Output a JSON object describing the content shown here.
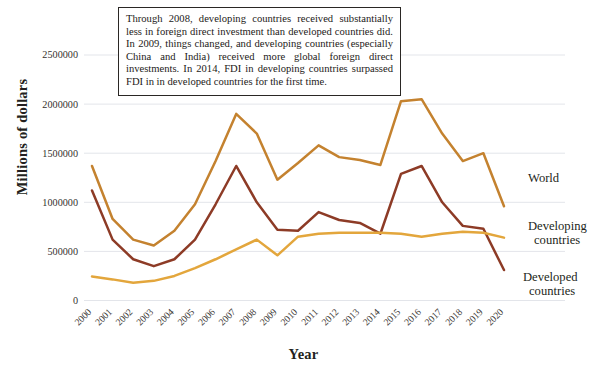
{
  "note": {
    "text": "Through 2008, developing countries received substantially less in foreign direct investment than developed countries did. In 2009, things changed, and developing countries (especially China and India) received more global foreign direct investments. In 2014, FDI in developing countries surpassed FDI in in developed countries for the first time."
  },
  "chart_data": {
    "type": "line",
    "title": "",
    "xlabel": "Year",
    "ylabel": "Millions of dollars",
    "grid": true,
    "legend_position": "right-inline",
    "ylim": [
      0,
      2750000
    ],
    "yticks": [
      0,
      500000,
      1000000,
      1500000,
      2000000,
      2500000
    ],
    "ytick_labels": [
      "0",
      "500000",
      "1000000",
      "1500000",
      "2000000",
      "2500000"
    ],
    "categories": [
      "2000",
      "2001",
      "2002",
      "2003",
      "2004",
      "2005",
      "2006",
      "2007",
      "2008",
      "2009",
      "2010",
      "2011",
      "2012",
      "2013",
      "2014",
      "2015",
      "2016",
      "2017",
      "2018",
      "2019",
      "2020"
    ],
    "series": [
      {
        "name": "World",
        "color": "#c4822f",
        "label_x": 531,
        "label_y": 184,
        "values": [
          1370000,
          830000,
          620000,
          560000,
          710000,
          980000,
          1420000,
          1900000,
          1700000,
          1230000,
          1400000,
          1580000,
          1460000,
          1430000,
          1380000,
          2030000,
          2050000,
          1700000,
          1420000,
          1500000,
          960000
        ]
      },
      {
        "name": "Developing countries",
        "color": "#8d3b26",
        "label_x": 528,
        "label_y": 288,
        "label_lines": [
          "Developed",
          "countries"
        ],
        "values": [
          1120000,
          620000,
          420000,
          350000,
          420000,
          620000,
          980000,
          1370000,
          1000000,
          720000,
          710000,
          900000,
          820000,
          790000,
          680000,
          1290000,
          1370000,
          1000000,
          760000,
          730000,
          310000
        ]
      },
      {
        "name": "Developing countries",
        "color": "#e3a63c",
        "label_x": 528,
        "label_y": 232,
        "label_lines": [
          "Developing",
          "countries"
        ],
        "values": [
          245000,
          215000,
          180000,
          200000,
          250000,
          330000,
          420000,
          520000,
          620000,
          460000,
          650000,
          680000,
          690000,
          690000,
          690000,
          680000,
          650000,
          680000,
          700000,
          690000,
          640000
        ]
      }
    ],
    "series_labels": [
      {
        "id": "world",
        "lines": [
          "World"
        ],
        "color": "#231f20",
        "x": 528,
        "y": 182
      },
      {
        "id": "developing",
        "lines": [
          "Developing",
          "countries"
        ],
        "color": "#231f20",
        "x": 528,
        "y": 230
      },
      {
        "id": "developed",
        "lines": [
          "Developed",
          "countries"
        ],
        "color": "#231f20",
        "x": 523,
        "y": 281
      }
    ]
  },
  "axis": {
    "ylabel": "Millions of dollars",
    "xlabel": "Year"
  }
}
